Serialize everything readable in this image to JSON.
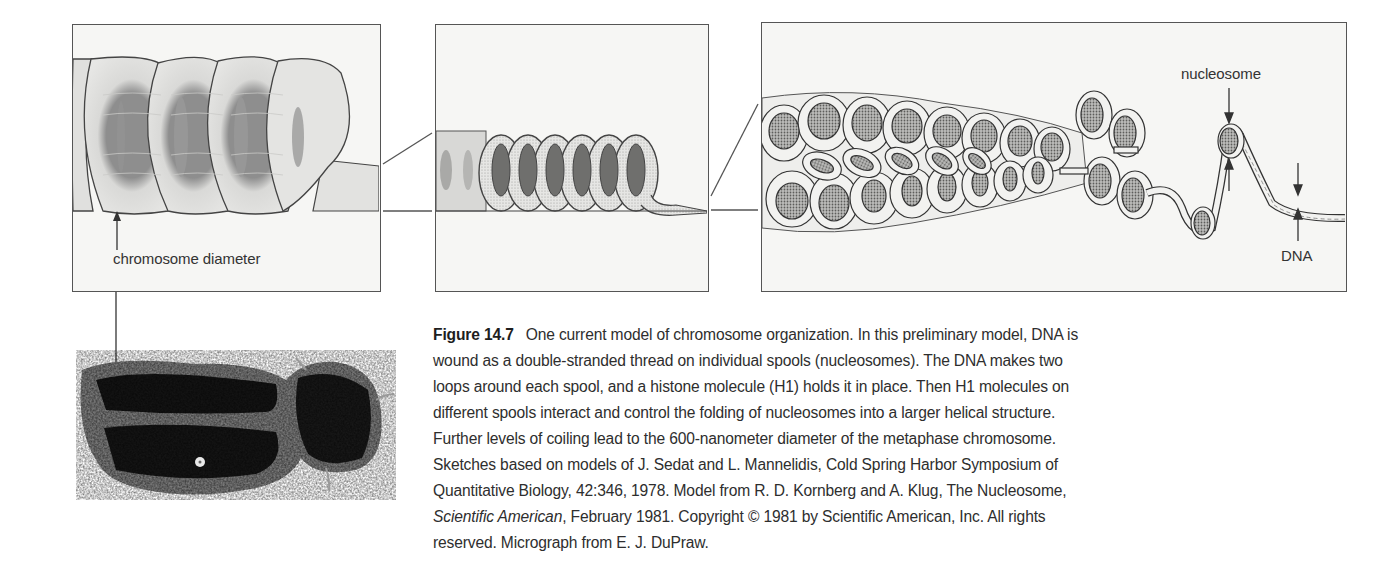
{
  "figure": {
    "number": "Figure 14.7",
    "panels": [
      {
        "id": "panel-chromosome-coil",
        "label": "chromosome diameter"
      },
      {
        "id": "panel-solenoid-coil"
      },
      {
        "id": "panel-nucleosome-fiber",
        "labels": {
          "nucleosome": "nucleosome",
          "dna": "DNA"
        }
      }
    ],
    "micrograph": {
      "description": "metaphase chromosome micrograph"
    }
  },
  "caption": {
    "lines": [
      {
        "lead": "Figure 14.7",
        "text": "One current model of chromosome organization. In this preliminary model, DNA is"
      },
      {
        "text": "wound as a double-stranded thread on individual spools (nucleosomes). The DNA makes two"
      },
      {
        "text": "loops around each spool, and a histone molecule (H1) holds it in place. Then H1 molecules on"
      },
      {
        "text": "different spools interact and control the folding of nucleosomes into a larger helical structure."
      },
      {
        "text": "Further levels of coiling lead to the 600-nanometer diameter of the metaphase chromosome."
      },
      {
        "text": "Sketches based on models of J. Sedat and L. Mannelidis, Cold Spring Harbor Symposium of"
      },
      {
        "text": "Quantitative Biology, 42:346, 1978.  Model from R. D. Kornberg and A. Klug, The Nucleosome,"
      },
      {
        "italic": "Scientific American",
        "text": ", February 1981. Copyright © 1981 by Scientific American, Inc. All rights"
      },
      {
        "text": "reserved. Micrograph from E. J. DuPraw."
      }
    ]
  },
  "colors": {
    "line": "#555555",
    "panel_bg": "#f6f6f4",
    "text": "#2e2e2e"
  }
}
